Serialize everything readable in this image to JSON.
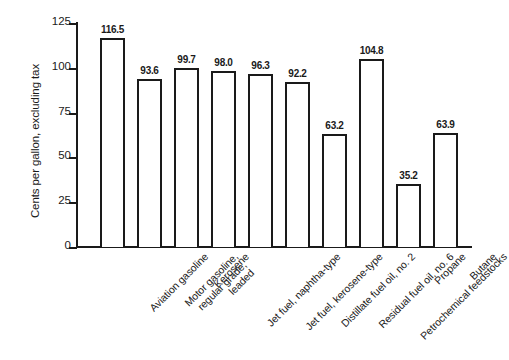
{
  "chart_data": {
    "type": "bar",
    "title": "",
    "xlabel": "",
    "ylabel": "Cents per gallon, excluding tax",
    "ylim": [
      0,
      125
    ],
    "yticks": [
      0,
      25,
      50,
      75,
      100,
      125
    ],
    "grid": false,
    "legend": null,
    "bar_style": {
      "fill": "#ffffff",
      "edge": "#1a1a1a",
      "value_labels": true
    },
    "categories": [
      "Aviation gasoline",
      "Motor gasoline, regular grade, leaded",
      "Kerosene",
      "Jet fuel, naphtha-type",
      "Jet fuel, kerosene-type",
      "Distillate fuel oil, no. 2",
      "Residual fuel oil, no. 6",
      "Petrochemical feedstocks",
      "Propane",
      "Butane"
    ],
    "category_lines": [
      [
        "Aviation gasoline"
      ],
      [
        "Motor gasoline,",
        "regular grade,",
        "leaded"
      ],
      [
        "Kerosene"
      ],
      [
        "Jet fuel, naphtha-type"
      ],
      [
        "Jet fuel, kerosene-type"
      ],
      [
        "Distillate fuel oil, no. 2"
      ],
      [
        "Residual fuel oil, no. 6"
      ],
      [
        "Petrochemical feedstocks"
      ],
      [
        "Propane"
      ],
      [
        "Butane"
      ]
    ],
    "values": [
      116.5,
      93.6,
      99.7,
      98.0,
      96.3,
      92.2,
      63.2,
      104.8,
      35.2,
      63.9
    ],
    "value_labels": [
      "116.5",
      "93.6",
      "99.7",
      "98.0",
      "96.3",
      "92.2",
      "63.2",
      "104.8",
      "35.2",
      "63.9"
    ],
    "ytick_labels": [
      "0",
      "25",
      "50",
      "75",
      "100",
      "125"
    ]
  }
}
